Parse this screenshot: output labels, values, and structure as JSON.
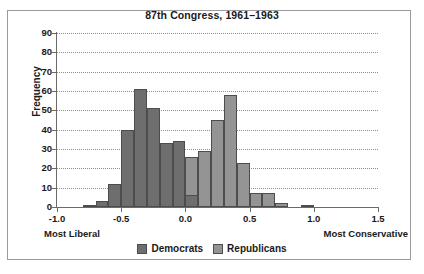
{
  "chart_data": {
    "type": "bar",
    "title": "87th Congress, 1961–1963",
    "xlabel": "",
    "ylabel": "Frequency",
    "xlim": [
      -1.0,
      1.5
    ],
    "ylim": [
      0,
      90
    ],
    "grid": true,
    "legend_position": "bottom",
    "bin_width": 0.1,
    "axis_annotations": {
      "left": "Most Liberal",
      "right": "Most Conservative"
    },
    "xticks": [
      "-1.0",
      "-0.5",
      "0.0",
      "0.5",
      "1.0",
      "1.5"
    ],
    "xtick_values": [
      -1.0,
      -0.5,
      0.0,
      0.5,
      1.0,
      1.5
    ],
    "yticks": [
      "0",
      "10",
      "20",
      "30",
      "40",
      "50",
      "60",
      "70",
      "80",
      "90"
    ],
    "ytick_values": [
      0,
      10,
      20,
      30,
      40,
      50,
      60,
      70,
      80,
      90
    ],
    "bin_starts": [
      -0.8,
      -0.7,
      -0.6,
      -0.5,
      -0.4,
      -0.3,
      -0.2,
      -0.1,
      0.0,
      0.1,
      0.2,
      0.3,
      0.4,
      0.5,
      0.6,
      0.7,
      0.9
    ],
    "series": [
      {
        "name": "Democrats",
        "color": "#6e6e6e",
        "values": [
          1,
          3,
          12,
          40,
          61,
          51,
          33,
          34,
          6,
          0,
          0,
          0,
          0,
          0,
          0,
          0,
          0
        ]
      },
      {
        "name": "Republicans",
        "color": "#949494",
        "values": [
          0,
          0,
          0,
          0,
          0,
          0,
          2,
          6,
          26,
          29,
          45,
          58,
          23,
          7,
          7,
          2,
          1
        ]
      }
    ]
  },
  "legend": {
    "items": [
      {
        "label": "Democrats",
        "swatch": "dem"
      },
      {
        "label": "Republicans",
        "swatch": "rep"
      }
    ]
  }
}
